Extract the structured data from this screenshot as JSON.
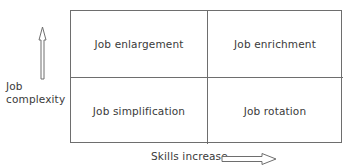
{
  "figure": {
    "type": "2x2-matrix-diagram",
    "background_color": "#ffffff",
    "line_color": "#6e6e6e",
    "text_color": "#3a3a3a"
  },
  "axes": {
    "y": {
      "label_line1": "Job",
      "label_line2": "complexity",
      "arrow_icon": "arrow-up-outline-icon",
      "direction": "up"
    },
    "x": {
      "label": "Skills increase",
      "arrow_icon": "arrow-right-outline-icon",
      "direction": "right"
    }
  },
  "quadrants": [
    {
      "position": "top-left",
      "label": "Job enlargement"
    },
    {
      "position": "top-right",
      "label": "Job enrichment"
    },
    {
      "position": "bottom-left",
      "label": "Job simplification"
    },
    {
      "position": "bottom-right",
      "label": "Job rotation"
    }
  ]
}
